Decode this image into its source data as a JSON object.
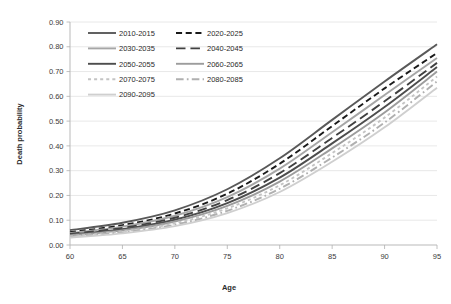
{
  "chart_data": {
    "type": "line",
    "title": "",
    "xlabel": "Age",
    "ylabel": "Death probability",
    "xlim": [
      60,
      95
    ],
    "ylim": [
      0.0,
      0.9
    ],
    "grid": true,
    "legend_position": "top-left-inside",
    "x_ticks": [
      "60",
      "65",
      "70",
      "75",
      "80",
      "85",
      "90",
      "95"
    ],
    "x_tick_values": [
      60,
      65,
      70,
      75,
      80,
      85,
      90,
      95
    ],
    "y_ticks": [
      "0.00",
      "0.10",
      "0.20",
      "0.30",
      "0.40",
      "0.50",
      "0.60",
      "0.70",
      "0.80",
      "0.90"
    ],
    "y_tick_values": [
      0.0,
      0.1,
      0.2,
      0.3,
      0.4,
      0.5,
      0.6,
      0.7,
      0.8,
      0.9
    ],
    "x": [
      60,
      65,
      70,
      75,
      80,
      85,
      90,
      95
    ],
    "series": [
      {
        "name": "2010-2015",
        "color": "#595959",
        "dash": "none",
        "width": 1.9,
        "values": [
          0.06,
          0.09,
          0.14,
          0.225,
          0.35,
          0.505,
          0.66,
          0.81
        ]
      },
      {
        "name": "2020-2025",
        "color": "#1a1a1a",
        "dash": "dashed",
        "width": 1.9,
        "values": [
          0.052,
          0.08,
          0.127,
          0.207,
          0.328,
          0.48,
          0.632,
          0.775
        ]
      },
      {
        "name": "2030-2035",
        "color": "#a6a6a6",
        "dash": "none",
        "width": 1.9,
        "values": [
          0.048,
          0.074,
          0.118,
          0.193,
          0.308,
          0.455,
          0.605,
          0.755
        ]
      },
      {
        "name": "2040-2045",
        "color": "#404040",
        "dash": "longdash",
        "width": 1.9,
        "values": [
          0.045,
          0.069,
          0.11,
          0.181,
          0.29,
          0.432,
          0.58,
          0.735
        ]
      },
      {
        "name": "2050-2055",
        "color": "#4d4d4d",
        "dash": "none",
        "width": 1.9,
        "values": [
          0.042,
          0.064,
          0.102,
          0.169,
          0.272,
          0.41,
          0.557,
          0.718
        ]
      },
      {
        "name": "2060-2065",
        "color": "#9c9c9c",
        "dash": "none",
        "width": 1.9,
        "values": [
          0.039,
          0.059,
          0.095,
          0.158,
          0.256,
          0.39,
          0.535,
          0.7
        ]
      },
      {
        "name": "2070-2075",
        "color": "#c4c4c4",
        "dash": "dotted",
        "width": 1.9,
        "values": [
          0.036,
          0.055,
          0.088,
          0.148,
          0.241,
          0.371,
          0.514,
          0.68
        ]
      },
      {
        "name": "2080-2085",
        "color": "#b0b0b0",
        "dash": "dashdot",
        "width": 1.9,
        "values": [
          0.033,
          0.051,
          0.082,
          0.138,
          0.227,
          0.353,
          0.494,
          0.66
        ]
      },
      {
        "name": "2090-2095",
        "color": "#cfcfcf",
        "dash": "none",
        "width": 1.9,
        "values": [
          0.03,
          0.047,
          0.076,
          0.129,
          0.214,
          0.336,
          0.475,
          0.635
        ]
      }
    ]
  },
  "legend": {
    "entries": [
      {
        "label": "2010-2015",
        "col": 0,
        "row": 0
      },
      {
        "label": "2020-2025",
        "col": 1,
        "row": 0
      },
      {
        "label": "2030-2035",
        "col": 0,
        "row": 1
      },
      {
        "label": "2040-2045",
        "col": 1,
        "row": 1
      },
      {
        "label": "2050-2055",
        "col": 0,
        "row": 2
      },
      {
        "label": "2060-2065",
        "col": 1,
        "row": 2
      },
      {
        "label": "2070-2075",
        "col": 0,
        "row": 3
      },
      {
        "label": "2080-2085",
        "col": 1,
        "row": 3
      },
      {
        "label": "2090-2095",
        "col": 0,
        "row": 4
      }
    ]
  },
  "axes": {
    "x_title": "Age",
    "y_title": "Death probability"
  },
  "colors": {
    "grid": "#e2e2e2",
    "frame": "#b9b9b9",
    "text": "#2b2b2b"
  }
}
